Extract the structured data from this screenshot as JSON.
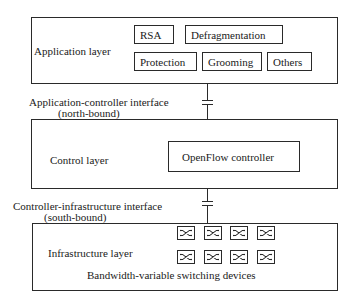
{
  "application_layer": {
    "label": "Application layer",
    "modules": [
      {
        "label": "RSA"
      },
      {
        "label": "Defragmentation"
      },
      {
        "label": "Protection"
      },
      {
        "label": "Grooming"
      },
      {
        "label": "Others"
      }
    ]
  },
  "northbound": {
    "line1": "Application-controller interface",
    "line2": "(north-bound)"
  },
  "control_layer": {
    "label": "Control layer",
    "controller": "OpenFlow controller"
  },
  "southbound": {
    "line1": "Controller-infrastructure interface",
    "line2": "(south-bound)"
  },
  "infrastructure_layer": {
    "label": "Infrastructure layer",
    "devices_caption": "Bandwidth-variable switching devices",
    "switch_rows": 2,
    "switch_cols": 4,
    "switch_icon": "crossbar-switch-icon"
  }
}
